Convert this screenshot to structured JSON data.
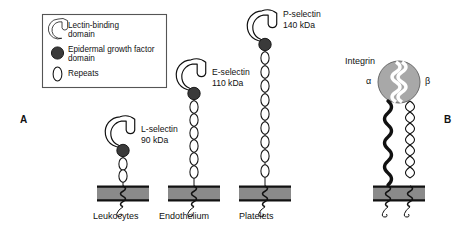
{
  "figure": {
    "title_panels": {
      "a": "A",
      "b": "B"
    },
    "background_color": "#ffffff",
    "line_color": "#111111",
    "membrane_fill": "#8a8a8a",
    "egf_fill": "#3a3a3a",
    "integrin_fill": "#a8a8a8"
  },
  "legend": {
    "items": [
      {
        "icon": "lectin-binding-domain-icon",
        "label_line1": "Lectin-binding",
        "label_line2": "domain"
      },
      {
        "icon": "egf-domain-icon",
        "label_line1": "Epidermal growth factor",
        "label_line2": "domain"
      },
      {
        "icon": "repeats-icon",
        "label_line1": "Repeats",
        "label_line2": ""
      }
    ]
  },
  "panel_a": {
    "letter": "A",
    "molecules": [
      {
        "name": "L-selectin",
        "mass": "90 kDa",
        "cell": "Leukocytes",
        "repeats": 2
      },
      {
        "name": "E-selectin",
        "mass": "110 kDa",
        "cell": "Endothelium",
        "repeats": 6
      },
      {
        "name": "P-selectin",
        "mass": "140 kDa",
        "cell": "Platelets",
        "repeats": 9
      }
    ]
  },
  "panel_b": {
    "letter": "B",
    "name": "Integrin",
    "subunit_alpha": "α",
    "subunit_beta": "β"
  }
}
